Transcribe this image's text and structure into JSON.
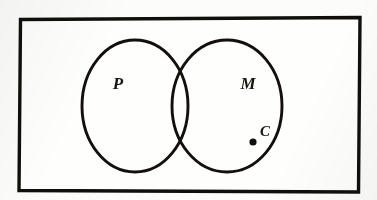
{
  "figure": {
    "type": "euler-venn-diagram",
    "background_color": "#fcfcfa",
    "ink_color": "#120f0c",
    "universe": {
      "name": "universal-set-rectangle",
      "label": "",
      "x": 20,
      "y": 18,
      "width": 340,
      "height": 173,
      "stroke_width": 3.4
    },
    "sets": [
      {
        "id": "P",
        "label": "P",
        "label_x": 118,
        "label_y": 89,
        "center_x": 135,
        "center_y": 106,
        "radius": 53,
        "stroke_width": 2.9
      },
      {
        "id": "M",
        "label": "M",
        "label_x": 248,
        "label_y": 89,
        "center_x": 227,
        "center_y": 106,
        "radius": 55,
        "stroke_width": 2.9
      }
    ],
    "points": [
      {
        "id": "C",
        "label": "C",
        "label_x": 265,
        "label_y": 136,
        "dot_x": 253,
        "dot_y": 142,
        "dot_radius": 3.6,
        "member_of": "M"
      }
    ],
    "label_font_size": 17,
    "point_label_font_size": 15
  }
}
